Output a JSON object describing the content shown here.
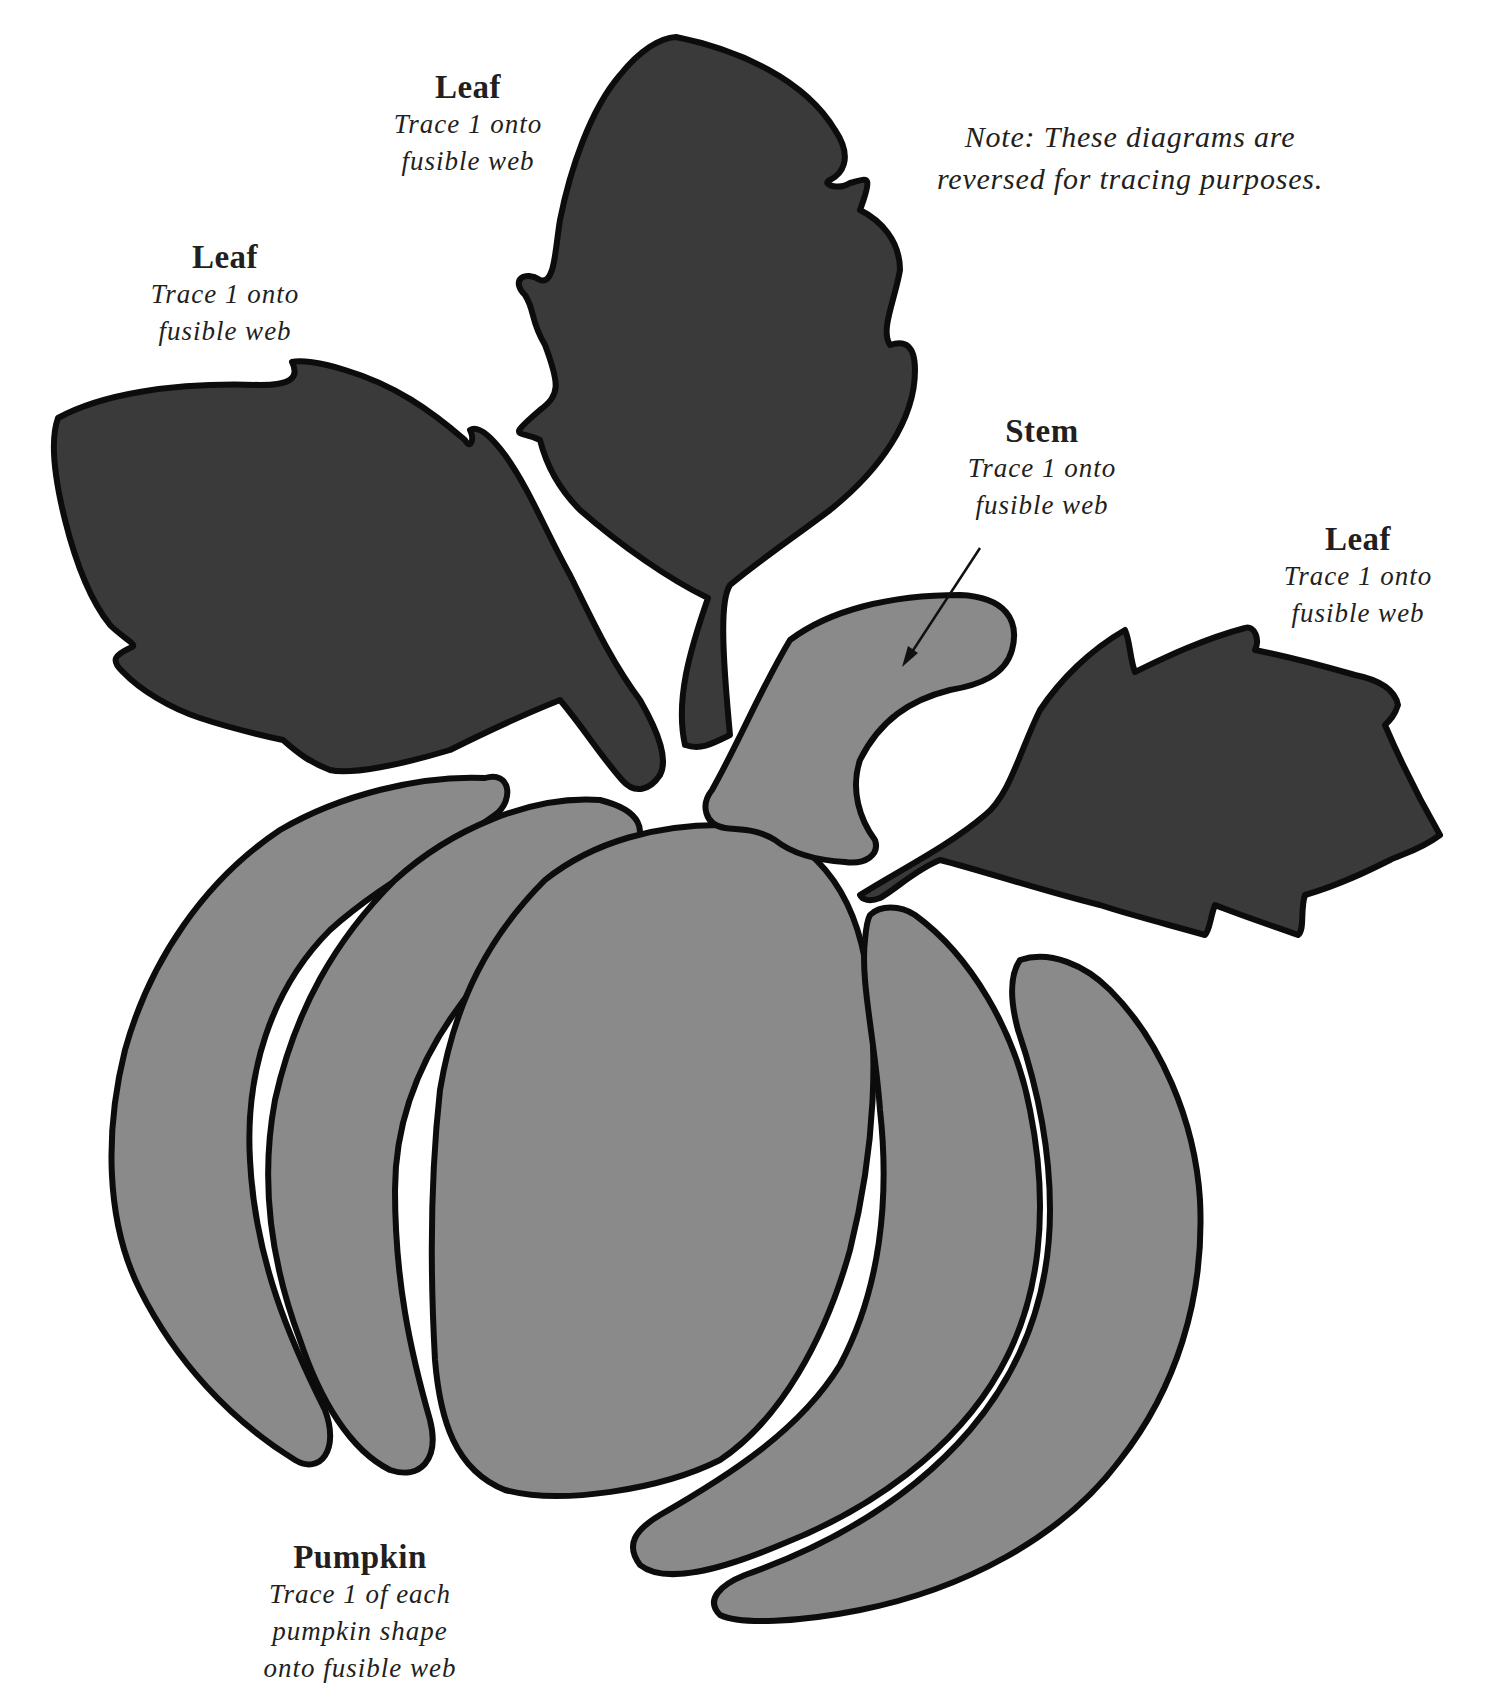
{
  "note": {
    "line1": "Note: These diagrams are",
    "line2": "reversed for tracing purposes."
  },
  "labels": {
    "leaf_top": {
      "title": "Leaf",
      "line1": "Trace 1 onto",
      "line2": "fusible web"
    },
    "leaf_left": {
      "title": "Leaf",
      "line1": "Trace 1 onto",
      "line2": "fusible web"
    },
    "stem": {
      "title": "Stem",
      "line1": "Trace 1 onto",
      "line2": "fusible web"
    },
    "leaf_right": {
      "title": "Leaf",
      "line1": "Trace 1 onto",
      "line2": "fusible web"
    },
    "pumpkin": {
      "title": "Pumpkin",
      "line1": "Trace 1 of each",
      "line2": "pumpkin shape",
      "line3": "onto fusible web"
    }
  },
  "colors": {
    "leaf_fill": "#3a3a3a",
    "pumpkin_fill": "#8a8a8a",
    "outline": "#0c0c0c",
    "background": "#ffffff",
    "text": "#231f20"
  },
  "pieces": [
    {
      "id": "leaf-top",
      "type": "leaf",
      "count": 1
    },
    {
      "id": "leaf-left",
      "type": "leaf",
      "count": 1
    },
    {
      "id": "leaf-right",
      "type": "leaf",
      "count": 1
    },
    {
      "id": "stem",
      "type": "stem",
      "count": 1
    },
    {
      "id": "pumpkin-sections",
      "type": "pumpkin",
      "count": 6
    }
  ]
}
